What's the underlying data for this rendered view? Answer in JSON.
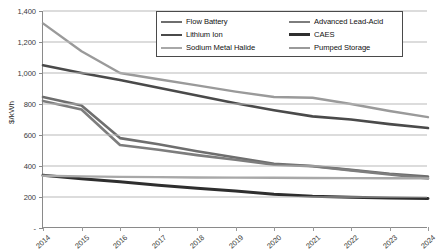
{
  "chart_data": {
    "type": "line",
    "title": "",
    "xlabel": "",
    "ylabel": "$/kWh",
    "x": [
      2014,
      2015,
      2016,
      2017,
      2018,
      2019,
      2020,
      2021,
      2022,
      2023,
      2024
    ],
    "xtick_labels": [
      "2014",
      "2015",
      "2016",
      "2017",
      "2018",
      "2019",
      "2020",
      "2021",
      "2022",
      "2023",
      "2024"
    ],
    "ytick_labels": [
      "1,400",
      "1,200",
      "1,000",
      "800",
      "600",
      "400",
      "200",
      "-"
    ],
    "ytick_values": [
      1400,
      1200,
      1000,
      800,
      600,
      400,
      200,
      0
    ],
    "ylim": [
      0,
      1400
    ],
    "xlim": [
      2014,
      2024
    ],
    "grid": "horizontal",
    "legend_position": "top-center",
    "series": [
      {
        "name": "Flow Battery",
        "color": "#6e6e6e",
        "values": [
          845,
          790,
          580,
          540,
          495,
          455,
          415,
          400,
          375,
          350,
          332
        ]
      },
      {
        "name": "Advanced Lead-Acid",
        "color": "#7d7d7d",
        "values": [
          820,
          765,
          535,
          505,
          470,
          440,
          408,
          398,
          372,
          345,
          320
        ]
      },
      {
        "name": "Lithium Ion",
        "color": "#4a4a4a",
        "values": [
          1050,
          1000,
          955,
          905,
          855,
          805,
          760,
          720,
          700,
          670,
          645
        ]
      },
      {
        "name": "CAES",
        "color": "#2e2e2e",
        "values": [
          340,
          318,
          298,
          276,
          256,
          238,
          218,
          205,
          198,
          193,
          190
        ]
      },
      {
        "name": "Sodium Metal Halide",
        "color": "#a8a8a8",
        "values": [
          337,
          333,
          330,
          328,
          326,
          325,
          324,
          323,
          322,
          321,
          320
        ]
      },
      {
        "name": "Pumped Storage",
        "color": "#9a9a9a",
        "values": [
          1320,
          1140,
          1000,
          960,
          920,
          880,
          845,
          840,
          800,
          755,
          715
        ]
      }
    ]
  },
  "legend": {
    "items": [
      {
        "label": "Flow Battery",
        "color": "#6e6e6e",
        "weight": 2.6
      },
      {
        "label": "Advanced Lead-Acid",
        "color": "#7d7d7d",
        "weight": 2.6
      },
      {
        "label": "Lithium Ion",
        "color": "#4a4a4a",
        "weight": 2.6
      },
      {
        "label": "CAES",
        "color": "#2e2e2e",
        "weight": 3.0
      },
      {
        "label": "Sodium Metal Halide",
        "color": "#a8a8a8",
        "weight": 2.4
      },
      {
        "label": "Pumped Storage",
        "color": "#9a9a9a",
        "weight": 2.4
      }
    ]
  },
  "axis": {
    "y_title": "$/kWh"
  },
  "colors": {
    "gridline": "#b9b9b9",
    "axis": "#8a8a8a",
    "text": "#3a3a3a",
    "legend_border": "#4a4a4a",
    "background": "#ffffff"
  }
}
